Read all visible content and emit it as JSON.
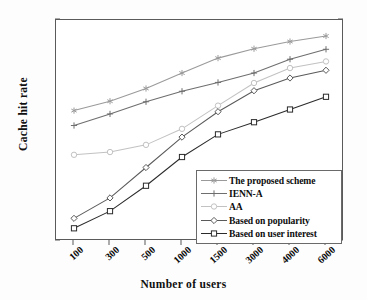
{
  "chart_data": {
    "type": "line",
    "title": "",
    "xlabel": "Number of users",
    "ylabel": "Cache hit rate",
    "categories": [
      "100",
      "300",
      "500",
      "1000",
      "1500",
      "3000",
      "4000",
      "6000"
    ],
    "x_axis_type": "categorical",
    "ylim": [
      0.6,
      1
    ],
    "ytick_labels": [
      "0.6",
      "0.65",
      "0.7",
      "0.75",
      "0.8",
      "0.85",
      "0.9",
      "0.95",
      "1"
    ],
    "ytick_values": [
      0.6,
      0.65,
      0.7,
      0.75,
      0.8,
      0.85,
      0.9,
      0.95,
      1
    ],
    "grid": false,
    "legend_position": "lower right",
    "series": [
      {
        "name": "The proposed scheme",
        "marker": "asterisk",
        "color": "#9a9a9a",
        "values": [
          0.836,
          0.853,
          0.876,
          0.904,
          0.931,
          0.948,
          0.961,
          0.971
        ]
      },
      {
        "name": "IENN-A",
        "marker": "plus",
        "color": "#6e6e6e",
        "values": [
          0.809,
          0.83,
          0.852,
          0.871,
          0.887,
          0.904,
          0.929,
          0.947
        ]
      },
      {
        "name": "AA",
        "marker": "circle",
        "color": "#c2c2c2",
        "values": [
          0.756,
          0.761,
          0.774,
          0.803,
          0.845,
          0.886,
          0.913,
          0.925
        ]
      },
      {
        "name": "Based on popularity",
        "marker": "diamond",
        "color": "#5a5a5a",
        "values": [
          0.641,
          0.678,
          0.733,
          0.788,
          0.834,
          0.872,
          0.895,
          0.909
        ]
      },
      {
        "name": "Based on user interest",
        "marker": "square",
        "color": "#2b2b2b",
        "values": [
          0.623,
          0.654,
          0.7,
          0.752,
          0.793,
          0.815,
          0.838,
          0.861
        ]
      }
    ]
  }
}
